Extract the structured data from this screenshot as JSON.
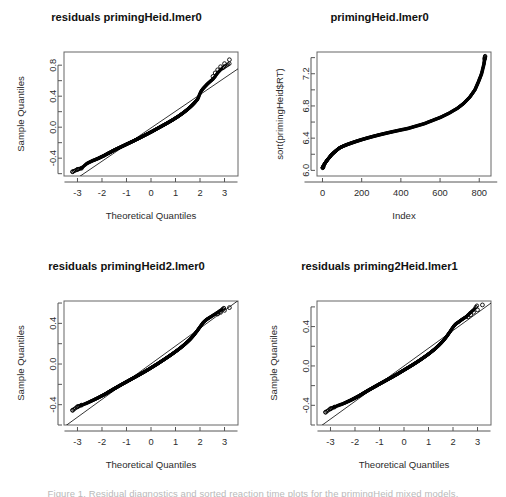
{
  "figure": {
    "layout": "2x2",
    "background": "#ffffff",
    "point_color": "#000000",
    "axis_color": "#666666",
    "bottom_cut_text": "Figure 1. Residual diagnostics and sorted reaction time plots for the primingHeid mixed models."
  },
  "panels": [
    {
      "id": "panel-1",
      "title": "residuals primingHeid.lmer0",
      "chart_data": {
        "type": "scatter",
        "plot_kind": "qqnorm",
        "title": "residuals primingHeid.lmer0",
        "xlabel": "Theoretical Quantiles",
        "ylabel": "Sample Quantiles",
        "xlim": [
          -3.55,
          3.55
        ],
        "ylim": [
          -0.63,
          0.97
        ],
        "xticks": [
          -3,
          -2,
          -1,
          0,
          1,
          2,
          3
        ],
        "xticklabels": [
          "-3",
          "-2",
          "-1",
          "0",
          "1",
          "2",
          "3"
        ],
        "yticks": [
          -0.4,
          0.0,
          0.4,
          0.8
        ],
        "yticklabels": [
          "-0.4",
          "0.0",
          "0.4",
          "0.8"
        ],
        "yminorticks": [
          -0.6,
          -0.2,
          0.2,
          0.6
        ],
        "grid": false,
        "legend": null,
        "reference_line": {
          "slope": 0.215,
          "intercept": -0.01,
          "label": "qqline"
        },
        "x": [
          -3.2,
          -3.0,
          -2.84,
          -2.72,
          -2.62,
          -2.53,
          -2.45,
          -2.38,
          -2.31,
          -2.25,
          -2.19,
          -2.13,
          -2.08,
          -2.03,
          -1.98,
          -1.93,
          -1.89,
          -1.84,
          -1.8,
          -1.76,
          -1.72,
          -1.68,
          -1.64,
          -1.6,
          -1.56,
          -1.52,
          -1.48,
          -1.44,
          -1.4,
          -1.36,
          -1.32,
          -1.28,
          -1.24,
          -1.2,
          -1.16,
          -1.12,
          -1.08,
          -1.04,
          -1.0,
          -0.96,
          -0.92,
          -0.88,
          -0.84,
          -0.8,
          -0.76,
          -0.72,
          -0.68,
          -0.64,
          -0.6,
          -0.56,
          -0.52,
          -0.48,
          -0.44,
          -0.4,
          -0.36,
          -0.32,
          -0.28,
          -0.24,
          -0.2,
          -0.16,
          -0.12,
          -0.08,
          -0.04,
          0.0,
          0.04,
          0.08,
          0.12,
          0.16,
          0.2,
          0.24,
          0.28,
          0.32,
          0.36,
          0.4,
          0.44,
          0.48,
          0.52,
          0.56,
          0.6,
          0.64,
          0.68,
          0.72,
          0.76,
          0.8,
          0.84,
          0.88,
          0.92,
          0.96,
          1.0,
          1.04,
          1.08,
          1.12,
          1.16,
          1.2,
          1.24,
          1.28,
          1.32,
          1.36,
          1.4,
          1.44,
          1.48,
          1.52,
          1.56,
          1.6,
          1.64,
          1.68,
          1.72,
          1.76,
          1.8,
          1.84,
          1.89,
          1.93,
          1.98,
          2.03,
          2.08,
          2.13,
          2.19,
          2.25,
          2.31,
          2.38,
          2.45,
          2.53,
          2.62,
          2.72,
          2.84,
          3.0,
          3.2
        ],
        "y": [
          -0.575,
          -0.545,
          -0.53,
          -0.497,
          -0.47,
          -0.455,
          -0.443,
          -0.432,
          -0.424,
          -0.416,
          -0.408,
          -0.4,
          -0.392,
          -0.384,
          -0.377,
          -0.37,
          -0.362,
          -0.354,
          -0.347,
          -0.34,
          -0.333,
          -0.327,
          -0.32,
          -0.313,
          -0.306,
          -0.3,
          -0.293,
          -0.287,
          -0.281,
          -0.275,
          -0.269,
          -0.263,
          -0.257,
          -0.251,
          -0.245,
          -0.239,
          -0.233,
          -0.227,
          -0.221,
          -0.215,
          -0.209,
          -0.203,
          -0.197,
          -0.191,
          -0.185,
          -0.179,
          -0.173,
          -0.166,
          -0.16,
          -0.154,
          -0.148,
          -0.141,
          -0.135,
          -0.128,
          -0.122,
          -0.115,
          -0.109,
          -0.102,
          -0.096,
          -0.089,
          -0.083,
          -0.076,
          -0.069,
          -0.063,
          -0.056,
          -0.049,
          -0.042,
          -0.035,
          -0.028,
          -0.021,
          -0.014,
          -0.007,
          0.0,
          0.007,
          0.014,
          0.021,
          0.028,
          0.035,
          0.042,
          0.049,
          0.056,
          0.064,
          0.071,
          0.078,
          0.086,
          0.093,
          0.101,
          0.109,
          0.117,
          0.125,
          0.133,
          0.141,
          0.15,
          0.159,
          0.168,
          0.177,
          0.186,
          0.196,
          0.206,
          0.216,
          0.226,
          0.237,
          0.248,
          0.259,
          0.271,
          0.283,
          0.296,
          0.309,
          0.323,
          0.338,
          0.355,
          0.38,
          0.42,
          0.455,
          0.48,
          0.5,
          0.52,
          0.54,
          0.56,
          0.58,
          0.6,
          0.62,
          0.655,
          0.7,
          0.74,
          0.78,
          0.82,
          0.87
        ],
        "n_points": 830,
        "outliers_high": [
          0.655,
          0.7,
          0.74,
          0.78,
          0.82,
          0.87
        ],
        "outliers_low": [
          -0.575,
          -0.545,
          -0.53
        ]
      }
    },
    {
      "id": "panel-2",
      "title": "primingHeid.lmer0",
      "chart_data": {
        "type": "scatter",
        "plot_kind": "sorted-index",
        "title": "primingHeid.lmer0",
        "xlabel": "Index",
        "ylabel": "sort(primingHeid$RT)",
        "xlim": [
          -28,
          860
        ],
        "ylim": [
          5.93,
          7.47
        ],
        "xticks": [
          0,
          200,
          400,
          600,
          800
        ],
        "xticklabels": [
          "0",
          "200",
          "400",
          "600",
          "800"
        ],
        "yticks": [
          6.0,
          6.4,
          6.8,
          7.2
        ],
        "yticklabels": [
          "6.0",
          "6.4",
          "6.8",
          "7.2"
        ],
        "yminorticks": [
          6.2,
          6.6,
          7.0,
          7.4
        ],
        "grid": false,
        "legend": null,
        "x": [
          1,
          8,
          16,
          25,
          35,
          45,
          58,
          72,
          88,
          105,
          125,
          148,
          172,
          198,
          226,
          256,
          288,
          322,
          358,
          396,
          436,
          478,
          520,
          562,
          604,
          646,
          688,
          720,
          752,
          778,
          796,
          812,
          824,
          830
        ],
        "y": [
          6.03,
          6.07,
          6.1,
          6.13,
          6.16,
          6.19,
          6.22,
          6.25,
          6.28,
          6.3,
          6.32,
          6.34,
          6.36,
          6.38,
          6.4,
          6.42,
          6.44,
          6.46,
          6.48,
          6.5,
          6.52,
          6.55,
          6.58,
          6.62,
          6.66,
          6.71,
          6.77,
          6.83,
          6.91,
          7.0,
          7.1,
          7.2,
          7.32,
          7.42
        ],
        "n_points": 830
      }
    },
    {
      "id": "panel-3",
      "title": "residuals primingHeid2.lmer0",
      "chart_data": {
        "type": "scatter",
        "plot_kind": "qqnorm",
        "title": "residuals primingHeid2.lmer0",
        "xlabel": "Theoretical Quantiles",
        "ylabel": "Sample Quantiles",
        "xlim": [
          -3.55,
          3.55
        ],
        "ylim": [
          -0.6,
          0.62
        ],
        "xticks": [
          -3,
          -2,
          -1,
          0,
          1,
          2,
          3
        ],
        "xticklabels": [
          "-3",
          "-2",
          "-1",
          "0",
          "1",
          "2",
          "3"
        ],
        "yticks": [
          -0.4,
          0.0,
          0.4
        ],
        "yticklabels": [
          "-0.4",
          "0.0",
          "0.4"
        ],
        "yminorticks": [
          -0.6,
          -0.2,
          0.2,
          0.6
        ],
        "grid": false,
        "legend": null,
        "reference_line": {
          "slope": 0.175,
          "intercept": 0.002,
          "label": "qqline"
        },
        "x": [
          -3.2,
          -3.0,
          -2.84,
          -2.72,
          -2.62,
          -2.53,
          -2.45,
          -2.38,
          -2.31,
          -2.25,
          -2.19,
          -2.13,
          -2.08,
          -2.03,
          -1.98,
          -1.93,
          -1.89,
          -1.84,
          -1.8,
          -1.76,
          -1.72,
          -1.68,
          -1.64,
          -1.6,
          -1.56,
          -1.52,
          -1.48,
          -1.44,
          -1.4,
          -1.36,
          -1.32,
          -1.28,
          -1.24,
          -1.2,
          -1.16,
          -1.12,
          -1.08,
          -1.04,
          -1.0,
          -0.96,
          -0.92,
          -0.88,
          -0.84,
          -0.8,
          -0.76,
          -0.72,
          -0.68,
          -0.64,
          -0.6,
          -0.56,
          -0.52,
          -0.48,
          -0.44,
          -0.4,
          -0.36,
          -0.32,
          -0.28,
          -0.24,
          -0.2,
          -0.16,
          -0.12,
          -0.08,
          -0.04,
          0.0,
          0.04,
          0.08,
          0.12,
          0.16,
          0.2,
          0.24,
          0.28,
          0.32,
          0.36,
          0.4,
          0.44,
          0.48,
          0.52,
          0.56,
          0.6,
          0.64,
          0.68,
          0.72,
          0.76,
          0.8,
          0.84,
          0.88,
          0.92,
          0.96,
          1.0,
          1.04,
          1.08,
          1.12,
          1.16,
          1.2,
          1.24,
          1.28,
          1.32,
          1.36,
          1.4,
          1.44,
          1.48,
          1.52,
          1.56,
          1.6,
          1.64,
          1.68,
          1.72,
          1.76,
          1.8,
          1.84,
          1.89,
          1.93,
          1.98,
          2.03,
          2.08,
          2.13,
          2.19,
          2.25,
          2.31,
          2.38,
          2.45,
          2.53,
          2.62,
          2.72,
          2.84,
          3.0,
          3.2
        ],
        "y": [
          -0.455,
          -0.42,
          -0.405,
          -0.395,
          -0.385,
          -0.375,
          -0.366,
          -0.358,
          -0.35,
          -0.343,
          -0.336,
          -0.329,
          -0.322,
          -0.316,
          -0.31,
          -0.304,
          -0.298,
          -0.292,
          -0.286,
          -0.28,
          -0.274,
          -0.268,
          -0.263,
          -0.257,
          -0.251,
          -0.246,
          -0.24,
          -0.235,
          -0.229,
          -0.224,
          -0.218,
          -0.213,
          -0.207,
          -0.202,
          -0.196,
          -0.191,
          -0.186,
          -0.18,
          -0.175,
          -0.17,
          -0.164,
          -0.159,
          -0.154,
          -0.148,
          -0.143,
          -0.138,
          -0.132,
          -0.127,
          -0.122,
          -0.116,
          -0.111,
          -0.106,
          -0.1,
          -0.095,
          -0.089,
          -0.084,
          -0.078,
          -0.073,
          -0.067,
          -0.061,
          -0.056,
          -0.05,
          -0.044,
          -0.038,
          -0.032,
          -0.026,
          -0.02,
          -0.014,
          -0.008,
          -0.002,
          0.004,
          0.01,
          0.017,
          0.023,
          0.029,
          0.036,
          0.042,
          0.048,
          0.055,
          0.061,
          0.068,
          0.074,
          0.081,
          0.088,
          0.094,
          0.101,
          0.108,
          0.115,
          0.122,
          0.129,
          0.136,
          0.143,
          0.151,
          0.158,
          0.166,
          0.174,
          0.182,
          0.19,
          0.198,
          0.207,
          0.216,
          0.225,
          0.234,
          0.244,
          0.254,
          0.265,
          0.276,
          0.288,
          0.3,
          0.313,
          0.327,
          0.342,
          0.358,
          0.375,
          0.392,
          0.408,
          0.422,
          0.434,
          0.445,
          0.455,
          0.466,
          0.478,
          0.492,
          0.508,
          0.528,
          0.555
        ],
        "n_points": 830,
        "outliers_high": [
          0.492,
          0.508,
          0.528,
          0.555
        ],
        "outliers_low": [
          -0.455,
          -0.42,
          -0.405
        ]
      }
    },
    {
      "id": "panel-4",
      "title": "residuals priming2Heid.lmer1",
      "chart_data": {
        "type": "scatter",
        "plot_kind": "qqnorm",
        "title": "residuals priming2Heid.lmer1",
        "xlabel": "Theoretical Quantiles",
        "ylabel": "Sample Quantiles",
        "xlim": [
          -3.55,
          3.55
        ],
        "ylim": [
          -0.6,
          0.66
        ],
        "xticks": [
          -3,
          -2,
          -1,
          0,
          1,
          2,
          3
        ],
        "xticklabels": [
          "-3",
          "-2",
          "-1",
          "0",
          "1",
          "2",
          "3"
        ],
        "yticks": [
          -0.4,
          0.0,
          0.4
        ],
        "yticklabels": [
          "-0.4",
          "0.0",
          "0.4"
        ],
        "yminorticks": [
          -0.6,
          -0.2,
          0.2,
          0.6
        ],
        "grid": false,
        "legend": null,
        "reference_line": {
          "slope": 0.18,
          "intercept": 0.0,
          "label": "qqline"
        },
        "x": [
          -3.2,
          -3.0,
          -2.84,
          -2.72,
          -2.62,
          -2.53,
          -2.45,
          -2.38,
          -2.31,
          -2.25,
          -2.19,
          -2.13,
          -2.08,
          -2.03,
          -1.98,
          -1.93,
          -1.89,
          -1.84,
          -1.8,
          -1.76,
          -1.72,
          -1.68,
          -1.64,
          -1.6,
          -1.56,
          -1.52,
          -1.48,
          -1.44,
          -1.4,
          -1.36,
          -1.32,
          -1.28,
          -1.24,
          -1.2,
          -1.16,
          -1.12,
          -1.08,
          -1.04,
          -1.0,
          -0.96,
          -0.92,
          -0.88,
          -0.84,
          -0.8,
          -0.76,
          -0.72,
          -0.68,
          -0.64,
          -0.6,
          -0.56,
          -0.52,
          -0.48,
          -0.44,
          -0.4,
          -0.36,
          -0.32,
          -0.28,
          -0.24,
          -0.2,
          -0.16,
          -0.12,
          -0.08,
          -0.04,
          0.0,
          0.04,
          0.08,
          0.12,
          0.16,
          0.2,
          0.24,
          0.28,
          0.32,
          0.36,
          0.4,
          0.44,
          0.48,
          0.52,
          0.56,
          0.6,
          0.64,
          0.68,
          0.72,
          0.76,
          0.8,
          0.84,
          0.88,
          0.92,
          0.96,
          1.0,
          1.04,
          1.08,
          1.12,
          1.16,
          1.2,
          1.24,
          1.28,
          1.32,
          1.36,
          1.4,
          1.44,
          1.48,
          1.52,
          1.56,
          1.6,
          1.64,
          1.68,
          1.72,
          1.76,
          1.8,
          1.84,
          1.89,
          1.93,
          1.98,
          2.03,
          2.08,
          2.13,
          2.19,
          2.25,
          2.31,
          2.38,
          2.45,
          2.53,
          2.62,
          2.72,
          2.84,
          3.0,
          3.2
        ],
        "y": [
          -0.47,
          -0.435,
          -0.418,
          -0.405,
          -0.396,
          -0.388,
          -0.38,
          -0.372,
          -0.364,
          -0.357,
          -0.35,
          -0.343,
          -0.336,
          -0.33,
          -0.323,
          -0.317,
          -0.311,
          -0.305,
          -0.299,
          -0.293,
          -0.287,
          -0.281,
          -0.275,
          -0.269,
          -0.263,
          -0.257,
          -0.251,
          -0.246,
          -0.24,
          -0.234,
          -0.229,
          -0.223,
          -0.217,
          -0.212,
          -0.206,
          -0.201,
          -0.195,
          -0.189,
          -0.184,
          -0.178,
          -0.173,
          -0.167,
          -0.162,
          -0.156,
          -0.151,
          -0.145,
          -0.14,
          -0.134,
          -0.129,
          -0.123,
          -0.118,
          -0.112,
          -0.107,
          -0.101,
          -0.095,
          -0.09,
          -0.084,
          -0.078,
          -0.072,
          -0.066,
          -0.06,
          -0.054,
          -0.048,
          -0.042,
          -0.036,
          -0.03,
          -0.024,
          -0.018,
          -0.012,
          -0.006,
          0.0,
          0.006,
          0.012,
          0.019,
          0.025,
          0.031,
          0.038,
          0.044,
          0.051,
          0.057,
          0.064,
          0.071,
          0.078,
          0.085,
          0.092,
          0.099,
          0.106,
          0.113,
          0.121,
          0.128,
          0.136,
          0.144,
          0.152,
          0.16,
          0.168,
          0.177,
          0.186,
          0.195,
          0.204,
          0.214,
          0.224,
          0.234,
          0.245,
          0.256,
          0.268,
          0.28,
          0.293,
          0.306,
          0.32,
          0.335,
          0.351,
          0.368,
          0.386,
          0.404,
          0.418,
          0.43,
          0.44,
          0.45,
          0.462,
          0.474,
          0.486,
          0.498,
          0.52,
          0.545,
          0.57,
          0.62
        ],
        "n_points": 830,
        "outliers_high": [
          0.498,
          0.52,
          0.545,
          0.57,
          0.62
        ],
        "outliers_low": [
          -0.47,
          -0.435,
          -0.418
        ]
      }
    }
  ]
}
